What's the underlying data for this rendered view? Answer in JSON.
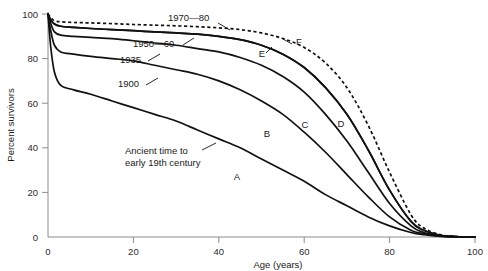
{
  "chart_data": {
    "type": "line",
    "title": "",
    "xlabel": "Age (years)",
    "ylabel": "Percent survivors",
    "xlim": [
      0,
      100
    ],
    "ylim": [
      0,
      100
    ],
    "xticks": [
      0,
      20,
      40,
      60,
      80,
      100
    ],
    "yticks": [
      0,
      20,
      40,
      60,
      80,
      100
    ],
    "grid": false,
    "legend_position": "inline-annotations",
    "annotations": [
      {
        "text_line1": "Ancient time to",
        "text_line2": "early 19th century",
        "for_series": "A"
      }
    ],
    "series": [
      {
        "name": "A",
        "label": "Ancient time to early 19th century",
        "letter": "A",
        "style": "solid",
        "x": [
          0,
          0.6,
          1.5,
          3,
          6,
          10,
          15,
          20,
          25,
          30,
          35,
          40,
          45,
          50,
          55,
          60,
          65,
          70,
          75,
          80,
          85,
          88,
          92,
          96,
          100
        ],
        "y": [
          100,
          86,
          74,
          68,
          66,
          64,
          61,
          58,
          55,
          52,
          48,
          44,
          40,
          35,
          30,
          25,
          19,
          14,
          9,
          5,
          2,
          1,
          0.3,
          0.1,
          0
        ]
      },
      {
        "name": "B",
        "label": "1900",
        "letter": "B",
        "style": "solid",
        "x": [
          0,
          0.6,
          1.5,
          3,
          6,
          10,
          15,
          20,
          25,
          30,
          35,
          40,
          45,
          50,
          55,
          60,
          65,
          70,
          75,
          80,
          85,
          88,
          92,
          96,
          100
        ],
        "y": [
          100,
          93,
          86,
          83,
          82,
          81,
          80,
          79,
          77,
          75,
          73,
          70,
          66,
          61,
          55,
          47,
          38,
          28,
          18,
          9,
          3,
          1.5,
          0.4,
          0.1,
          0
        ]
      },
      {
        "name": "C",
        "label": "1935",
        "letter": "C",
        "style": "solid",
        "x": [
          0,
          0.6,
          1.5,
          3,
          6,
          10,
          15,
          20,
          25,
          30,
          35,
          40,
          45,
          50,
          55,
          60,
          65,
          70,
          75,
          80,
          85,
          88,
          92,
          96,
          100
        ],
        "y": [
          100,
          96,
          92,
          90.5,
          90,
          89.5,
          89,
          88,
          87,
          86,
          84.5,
          83,
          80.5,
          77,
          72,
          65,
          55,
          43,
          29,
          15,
          5,
          2,
          0.5,
          0.1,
          0
        ]
      },
      {
        "name": "D",
        "label": "1950—60",
        "letter": "D",
        "style": "solid",
        "x": [
          0,
          0.6,
          1.5,
          3,
          6,
          10,
          15,
          20,
          25,
          30,
          35,
          40,
          45,
          50,
          55,
          60,
          65,
          70,
          75,
          80,
          85,
          88,
          92,
          96,
          100
        ],
        "y": [
          100,
          97.5,
          95.5,
          94.5,
          94,
          93.5,
          93,
          92.5,
          92,
          91.5,
          91,
          90,
          88.5,
          86,
          82,
          76,
          67,
          55,
          39,
          21,
          7,
          3,
          0.7,
          0.1,
          0
        ]
      },
      {
        "name": "E",
        "label": "1950—60 upper",
        "letter": "E",
        "style": "solid",
        "x": [
          0,
          0.6,
          1.5,
          3,
          6,
          10,
          15,
          20,
          25,
          30,
          35,
          40,
          45,
          50,
          55,
          60,
          65,
          70,
          75,
          80,
          85,
          88,
          92,
          96,
          100
        ],
        "y": [
          100,
          97.5,
          95.5,
          94.5,
          94,
          93.5,
          93,
          92.5,
          92,
          91.5,
          91,
          90,
          88.5,
          86,
          82,
          76,
          67,
          55,
          39,
          21,
          7,
          3,
          0.7,
          0.1,
          0
        ]
      },
      {
        "name": "F",
        "label": "1970—80",
        "letter": "F",
        "style": "dashed",
        "x": [
          0,
          0.6,
          1.5,
          3,
          6,
          10,
          15,
          20,
          25,
          30,
          35,
          40,
          45,
          50,
          55,
          60,
          65,
          70,
          75,
          80,
          85,
          88,
          92,
          96,
          100
        ],
        "y": [
          100,
          98.5,
          97,
          96.5,
          96.2,
          96,
          95.7,
          95.3,
          95,
          94.7,
          94.3,
          93.8,
          93,
          91.5,
          89,
          85,
          78,
          67,
          50,
          29,
          10,
          4,
          1,
          0.2,
          0
        ]
      }
    ],
    "series_labels": [
      {
        "text": "1970—80",
        "letter": "F"
      },
      {
        "text": "1950—60",
        "letter": "E"
      },
      {
        "text": "1935",
        "letter": "D"
      },
      {
        "text": "1900",
        "letter": "C"
      }
    ],
    "letters": [
      "A",
      "B",
      "C",
      "D",
      "E",
      "F"
    ]
  }
}
